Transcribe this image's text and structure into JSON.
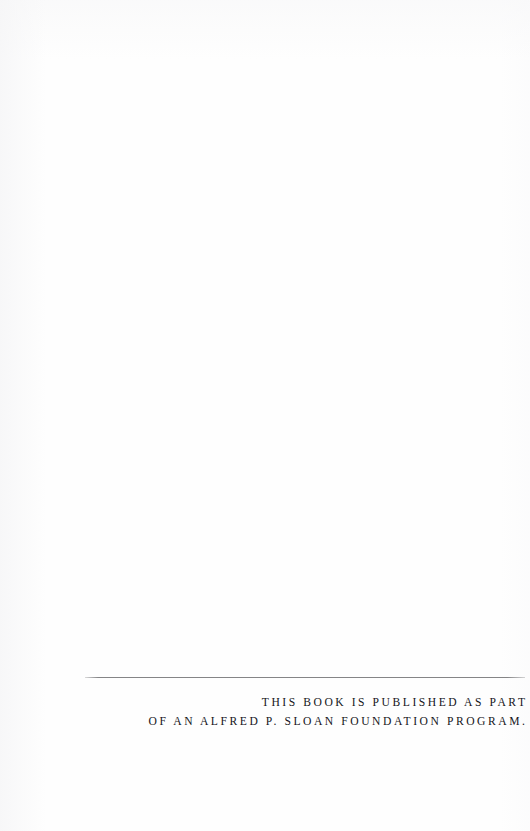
{
  "page": {
    "kind": "book-colophon-page",
    "background_color": "#fefefe",
    "text_color": "#15151a",
    "rule_color": "#7e7e80"
  },
  "colophon": {
    "rule": "horizontal-rule",
    "lines": [
      "THIS BOOK IS PUBLISHED AS PART",
      "OF AN ALFRED P. SLOAN FOUNDATION PROGRAM."
    ]
  }
}
